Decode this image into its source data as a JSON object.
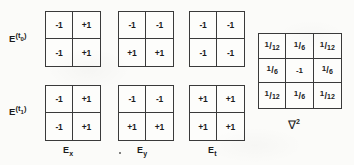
{
  "figure": {
    "background_color": "#fbfbf9",
    "ink_color": "#1b1b1b",
    "border_color": "#3a3a3a"
  },
  "row_labels": [
    {
      "base": "E",
      "superscript_open": "(t",
      "superscript_sub": "0",
      "superscript_close": ")",
      "full": "E^(t0)"
    },
    {
      "base": "E",
      "superscript_open": "(t",
      "superscript_sub": "1",
      "superscript_close": ")",
      "full": "E^(t1)"
    }
  ],
  "column_captions": [
    {
      "base": "E",
      "sub": "x",
      "full": "Ex"
    },
    {
      "base": "E",
      "sub": "y",
      "full": "Ey"
    },
    {
      "base": "E",
      "sub": "t",
      "full": "Et"
    }
  ],
  "matrices": [
    {
      "name": "Ex-t0",
      "row_label": "E^(t0)",
      "column": "Ex",
      "size": [
        2,
        2
      ],
      "values": [
        [
          "-1",
          "+1"
        ],
        [
          "-1",
          "+1"
        ]
      ]
    },
    {
      "name": "Ey-t0",
      "row_label": "E^(t0)",
      "column": "Ey",
      "size": [
        2,
        2
      ],
      "values": [
        [
          "-1",
          "-1"
        ],
        [
          "+1",
          "+1"
        ]
      ]
    },
    {
      "name": "Et-t0",
      "row_label": "E^(t0)",
      "column": "Et",
      "size": [
        2,
        2
      ],
      "values": [
        [
          "-1",
          "-1"
        ],
        [
          "-1",
          "-1"
        ]
      ]
    },
    {
      "name": "Ex-t1",
      "row_label": "E^(t1)",
      "column": "Ex",
      "size": [
        2,
        2
      ],
      "values": [
        [
          "-1",
          "+1"
        ],
        [
          "-1",
          "+1"
        ]
      ]
    },
    {
      "name": "Ey-t1",
      "row_label": "E^(t1)",
      "column": "Ey",
      "size": [
        2,
        2
      ],
      "values": [
        [
          "-1",
          "-1"
        ],
        [
          "+1",
          "+1"
        ]
      ]
    },
    {
      "name": "Et-t1",
      "row_label": "E^(t1)",
      "column": "Et",
      "size": [
        2,
        2
      ],
      "values": [
        [
          "+1",
          "+1"
        ],
        [
          "+1",
          "+1"
        ]
      ]
    }
  ],
  "laplacian": {
    "name": "laplacian-kernel",
    "caption": "∇2",
    "caption_symbol": "∇",
    "caption_exponent": "2",
    "size": [
      3,
      3
    ],
    "values": [
      [
        "1/12",
        "1/6",
        "1/12"
      ],
      [
        "1/6",
        "-1",
        "1/6"
      ],
      [
        "1/12",
        "1/6",
        "1/12"
      ]
    ],
    "cells": [
      {
        "kind": "fraction",
        "num": "1",
        "den": "12"
      },
      {
        "kind": "fraction",
        "num": "1",
        "den": "6"
      },
      {
        "kind": "fraction",
        "num": "1",
        "den": "12"
      },
      {
        "kind": "fraction",
        "num": "1",
        "den": "6"
      },
      {
        "kind": "plain",
        "text": "-1"
      },
      {
        "kind": "fraction",
        "num": "1",
        "den": "6"
      },
      {
        "kind": "fraction",
        "num": "1",
        "den": "12"
      },
      {
        "kind": "fraction",
        "num": "1",
        "den": "6"
      },
      {
        "kind": "fraction",
        "num": "1",
        "den": "12"
      }
    ]
  }
}
